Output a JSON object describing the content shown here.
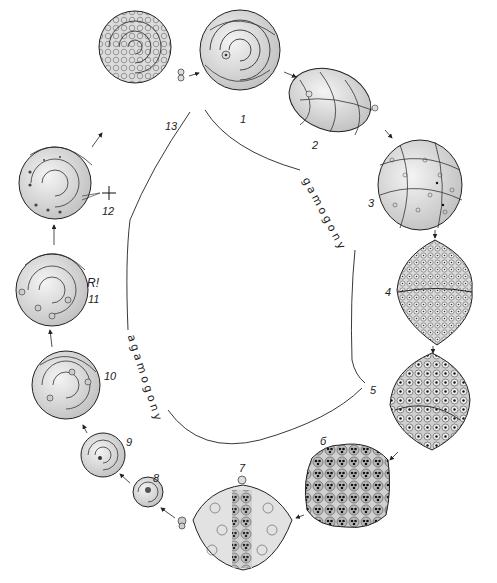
{
  "phases": {
    "gamogony": "gamogony",
    "agamogony": "agamogony"
  },
  "stages": [
    {
      "id": "1",
      "label": "1",
      "desc": "mature gamont shell (top view)"
    },
    {
      "id": "2",
      "label": "2",
      "desc": "gamont, side view"
    },
    {
      "id": "3",
      "label": "3",
      "desc": "gamont with multiplying nuclei"
    },
    {
      "id": "4",
      "label": "4",
      "desc": "gamete formation"
    },
    {
      "id": "5",
      "label": "5",
      "desc": "gametes released"
    },
    {
      "id": "6",
      "label": "б",
      "desc": "zygote aggregates"
    },
    {
      "id": "7",
      "label": "7",
      "desc": "young agamonts inside parent shell"
    },
    {
      "id": "8",
      "label": "8",
      "desc": "young agamont"
    },
    {
      "id": "9",
      "label": "9",
      "desc": "growing agamont"
    },
    {
      "id": "10",
      "label": "10",
      "desc": "multinucleate agamont"
    },
    {
      "id": "11",
      "label": "11",
      "desc": "agamont at meiosis"
    },
    {
      "id": "12",
      "label": "12",
      "desc": "agamont releasing embryos"
    },
    {
      "id": "13",
      "label": "13",
      "desc": "agamont producing young gamonts"
    }
  ],
  "annotations": {
    "meiosis_marker": "R!",
    "cross_marker": "+"
  },
  "colors": {
    "ink": "#222222",
    "shell_fill": "#e4e4e4",
    "shell_shade": "#c8c8c8",
    "background": "#ffffff"
  }
}
